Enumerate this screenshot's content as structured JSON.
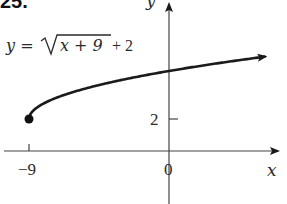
{
  "problem_number": "25.",
  "equation": {
    "lhs": "y =",
    "radicand": "x + 9",
    "rest": "+ 2"
  },
  "axes": {
    "x_label": "x",
    "y_label": "y",
    "x_ticks": [
      {
        "value": -9,
        "label": "−9"
      },
      {
        "value": 0,
        "label": "0"
      }
    ],
    "y_ticks": [
      {
        "value": 2,
        "label": "2"
      }
    ]
  },
  "colors": {
    "curve": "#1a1a1a",
    "axis": "#444444"
  },
  "chart_data": {
    "type": "line",
    "xlabel": "x",
    "ylabel": "y",
    "x_tick_labels": [
      "−9",
      "0"
    ],
    "y_tick_labels": [
      "2"
    ],
    "grid": false,
    "legend": null,
    "series": [
      {
        "name": "y = sqrt(x+9) + 2",
        "start_point": {
          "x": -9,
          "y": 2,
          "marker": "closed-dot"
        },
        "end": "arrow",
        "x": [
          -9,
          -8,
          -5,
          0,
          3,
          6
        ],
        "y": [
          2,
          3,
          4,
          5,
          5.46,
          5.87
        ]
      }
    ],
    "xlim": [
      -10.5,
      7
    ],
    "ylim": [
      -3,
      9.5
    ]
  }
}
